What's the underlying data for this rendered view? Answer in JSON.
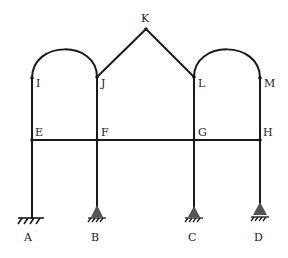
{
  "diagram": {
    "type": "structural-frame",
    "colors": {
      "line": "#1a1a1a",
      "support": "#555555",
      "background": "#ffffff"
    },
    "nodes": {
      "A": {
        "label": "A",
        "x": 32,
        "y": 218
      },
      "B": {
        "label": "B",
        "x": 97,
        "y": 218
      },
      "C": {
        "label": "C",
        "x": 194,
        "y": 218
      },
      "D": {
        "label": "D",
        "x": 260,
        "y": 218
      },
      "E": {
        "label": "E",
        "x": 32,
        "y": 140
      },
      "F": {
        "label": "F",
        "x": 97,
        "y": 140
      },
      "G": {
        "label": "G",
        "x": 194,
        "y": 140
      },
      "H": {
        "label": "H",
        "x": 260,
        "y": 140
      },
      "I": {
        "label": "I",
        "x": 32,
        "y": 78
      },
      "J": {
        "label": "J",
        "x": 97,
        "y": 77
      },
      "K": {
        "label": "K",
        "x": 146,
        "y": 29
      },
      "L": {
        "label": "L",
        "x": 194,
        "y": 77
      },
      "M": {
        "label": "M",
        "x": 260,
        "y": 78
      }
    },
    "members": [
      {
        "from": "A",
        "to": "E",
        "shape": "straight"
      },
      {
        "from": "E",
        "to": "I",
        "shape": "straight"
      },
      {
        "from": "B",
        "to": "F",
        "shape": "straight"
      },
      {
        "from": "F",
        "to": "J",
        "shape": "straight"
      },
      {
        "from": "C",
        "to": "G",
        "shape": "straight"
      },
      {
        "from": "G",
        "to": "L",
        "shape": "straight"
      },
      {
        "from": "D",
        "to": "H",
        "shape": "straight"
      },
      {
        "from": "H",
        "to": "M",
        "shape": "straight"
      },
      {
        "from": "E",
        "to": "H",
        "shape": "straight"
      },
      {
        "from": "J",
        "to": "K",
        "shape": "straight"
      },
      {
        "from": "K",
        "to": "L",
        "shape": "straight"
      },
      {
        "from": "I",
        "to": "J",
        "shape": "semicircular-arch"
      },
      {
        "from": "L",
        "to": "M",
        "shape": "semicircular-arch"
      }
    ],
    "supports": [
      {
        "node": "A",
        "type": "fixed"
      },
      {
        "node": "B",
        "type": "pinned"
      },
      {
        "node": "C",
        "type": "pinned"
      },
      {
        "node": "D",
        "type": "pinned"
      }
    ],
    "labels": {
      "A": "A",
      "B": "B",
      "C": "C",
      "D": "D",
      "E": "E",
      "F": "F",
      "G": "G",
      "H": "H",
      "I": "I",
      "J": "J",
      "K": "K",
      "L": "L",
      "M": "M"
    }
  }
}
